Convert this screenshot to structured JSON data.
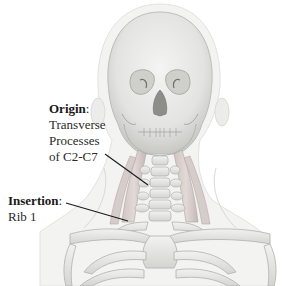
{
  "diagram": {
    "origin": {
      "title": "Origin",
      "title_suffix": ":",
      "lines": [
        "Transverse",
        "Processes",
        "of C2-C7"
      ]
    },
    "insertion": {
      "title": "Insertion",
      "title_suffix": ":",
      "lines": [
        "Rib 1"
      ]
    },
    "caption": ""
  },
  "colors": {
    "background": "#ffffff",
    "bone": "#e9e9e7",
    "bone_shadow": "#c9c9c6",
    "soft_tissue": "#f1f1f0",
    "muscle": "#d9cfcc",
    "muscle_stroke": "#b8aca8",
    "leader_line": "#1a1a1a",
    "text": "#2a2a2a"
  }
}
